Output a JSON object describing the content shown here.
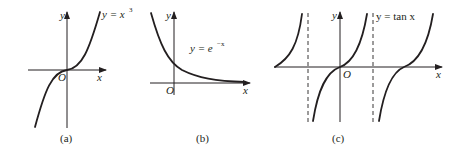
{
  "figure": {
    "panels": [
      {
        "id": "a",
        "caption": "(a)",
        "function_label": {
          "lhs": "y = x",
          "exponent": "3"
        },
        "axis_labels": {
          "x": "x",
          "y": "y",
          "origin": "O"
        }
      },
      {
        "id": "b",
        "caption": "(b)",
        "function_label": {
          "lhs": "y = e",
          "exponent": "−x"
        },
        "axis_labels": {
          "x": "x",
          "y": "y",
          "origin": "O"
        }
      },
      {
        "id": "c",
        "caption": "(c)",
        "function_label": {
          "text": "y = tan x"
        },
        "axis_labels": {
          "x": "x",
          "y": "y",
          "origin": "O"
        }
      }
    ],
    "colors": {
      "ink": "#231f20",
      "background": "#ffffff"
    }
  }
}
